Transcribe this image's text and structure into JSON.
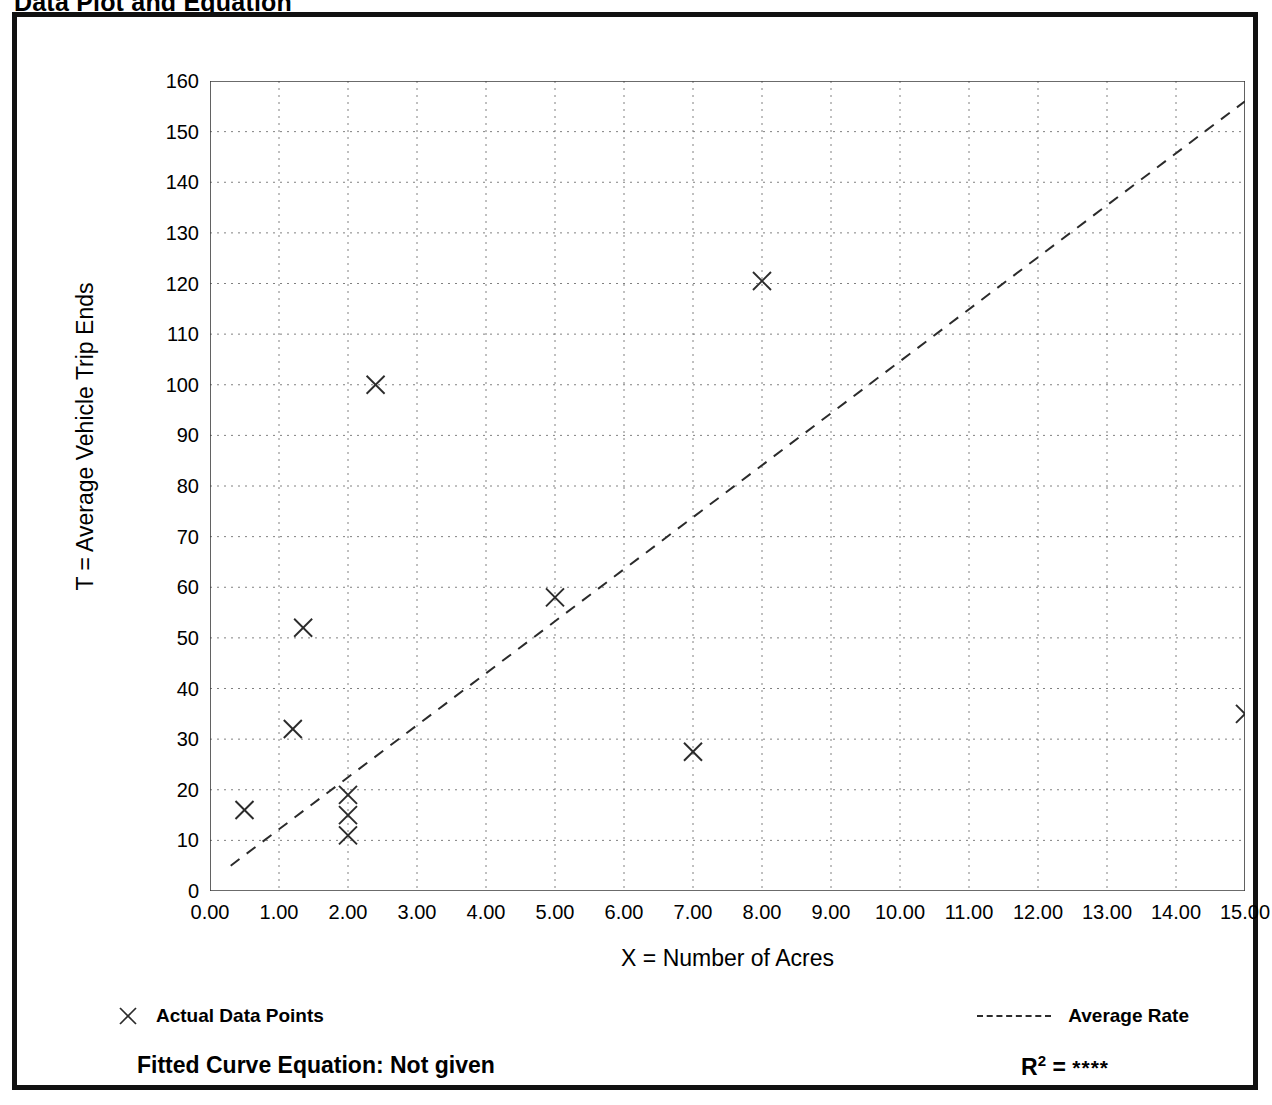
{
  "page": {
    "title": "Data Plot and Equation"
  },
  "legend": {
    "data_points_label": "Actual Data Points",
    "data_points_marker": "x-marker-icon",
    "average_rate_label": "Average Rate",
    "average_rate_marker": "dashed-line-icon"
  },
  "equation": {
    "fitted_label": "Fitted Curve Equation:  Not given",
    "r_symbol": "R",
    "r_exponent": "2",
    "r_equals": " = ",
    "r_value": "****"
  },
  "chart_data": {
    "type": "scatter",
    "title": "Data Plot and Equation",
    "xlabel": "X = Number of Acres",
    "ylabel": "T = Average Vehicle Trip Ends",
    "xlim": [
      0,
      15
    ],
    "ylim": [
      0,
      160
    ],
    "grid": true,
    "x_major_step": 1,
    "x_minor_step": 0.5,
    "y_major_step": 10,
    "y_minor_step": 5,
    "xticks": [
      "0.00",
      "1.00",
      "2.00",
      "3.00",
      "4.00",
      "5.00",
      "6.00",
      "7.00",
      "8.00",
      "9.00",
      "10.00",
      "11.00",
      "12.00",
      "13.00",
      "14.00",
      "15.00"
    ],
    "xtick_values": [
      0,
      1,
      2,
      3,
      4,
      5,
      6,
      7,
      8,
      9,
      10,
      11,
      12,
      13,
      14,
      15
    ],
    "yticks": [
      "0",
      "10",
      "20",
      "30",
      "40",
      "50",
      "60",
      "70",
      "80",
      "90",
      "100",
      "110",
      "120",
      "130",
      "140",
      "150",
      "160"
    ],
    "ytick_values": [
      0,
      10,
      20,
      30,
      40,
      50,
      60,
      70,
      80,
      90,
      100,
      110,
      120,
      130,
      140,
      150,
      160
    ],
    "legend_position": "below-plot",
    "series": [
      {
        "name": "Actual Data Points",
        "type": "scatter",
        "marker": "x",
        "points": [
          {
            "x": 0.5,
            "y": 16
          },
          {
            "x": 1.2,
            "y": 32
          },
          {
            "x": 1.35,
            "y": 52
          },
          {
            "x": 2.0,
            "y": 19
          },
          {
            "x": 2.0,
            "y": 15
          },
          {
            "x": 2.0,
            "y": 11
          },
          {
            "x": 2.4,
            "y": 100
          },
          {
            "x": 5.0,
            "y": 58
          },
          {
            "x": 7.0,
            "y": 27.5
          },
          {
            "x": 8.0,
            "y": 120.5
          },
          {
            "x": 15.0,
            "y": 35
          }
        ]
      },
      {
        "name": "Average Rate",
        "type": "line",
        "style": "dashed",
        "points": [
          {
            "x": 0.3,
            "y": 5
          },
          {
            "x": 15.0,
            "y": 156
          }
        ]
      }
    ]
  }
}
